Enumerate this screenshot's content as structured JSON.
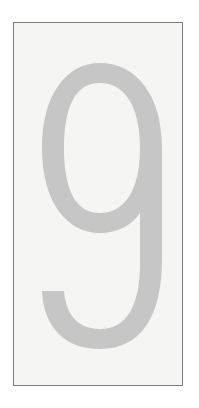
{
  "card": {
    "digit": "9",
    "colors": {
      "background": "#ffffff",
      "frame_fill": "#f5f5f4",
      "frame_border": "#7a7a7a",
      "digit_fill": "#c6c6c6"
    }
  }
}
